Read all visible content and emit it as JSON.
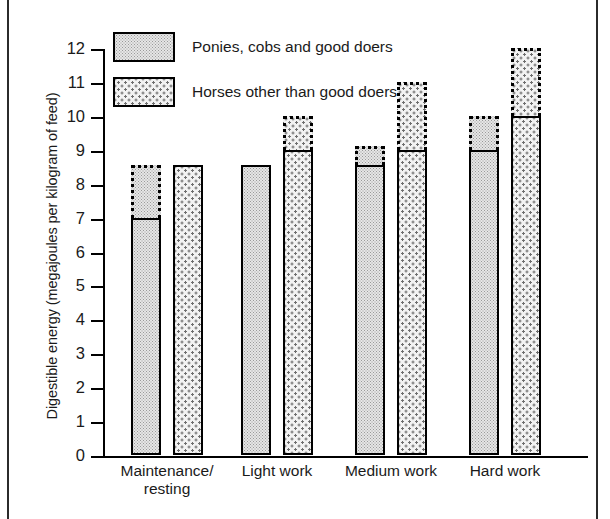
{
  "figure": {
    "ylabel": "Digestible energy (megajoules per kilogram of feed)"
  },
  "legend": {
    "items": [
      {
        "label": "Ponies, cobs and good doers",
        "swatch": "fine-stipple-swatch"
      },
      {
        "label": "Horses other than good doers",
        "swatch": "coarse-dot-swatch"
      }
    ]
  },
  "axis": {
    "yticks": [
      "0",
      "1",
      "2",
      "3",
      "4",
      "5",
      "6",
      "7",
      "8",
      "9",
      "10",
      "11",
      "12"
    ],
    "xticks": [
      {
        "line1": "Maintenance/",
        "line2": "resting"
      },
      {
        "line1": "Light work",
        "line2": ""
      },
      {
        "line1": "Medium work",
        "line2": ""
      },
      {
        "line1": "Hard work",
        "line2": ""
      }
    ]
  },
  "chart_data": {
    "type": "bar",
    "title": "",
    "xlabel": "",
    "ylabel": "Digestible energy (megajoules per kilogram of feed)",
    "ylim": [
      0,
      12
    ],
    "ytick_step": 1,
    "grid": false,
    "legend_position": "top-left-inside",
    "categories": [
      "Maintenance/resting",
      "Light work",
      "Medium work",
      "Hard work"
    ],
    "series": [
      {
        "name": "Ponies, cobs and good doers",
        "values": [
          7.0,
          8.55,
          8.55,
          9.0
        ],
        "range_top": [
          8.55,
          8.55,
          9.1,
          10.0
        ],
        "fill": "fine-stipple",
        "note": "solid outline = typical value; dotted outline above = upper end of range"
      },
      {
        "name": "Horses other than good doers",
        "values": [
          8.55,
          9.0,
          9.0,
          10.0
        ],
        "range_top": [
          8.55,
          10.0,
          11.0,
          12.0
        ],
        "fill": "coarse-dot",
        "note": "solid outline = typical value; dotted outline above = upper end of range"
      }
    ]
  },
  "colors": {
    "ink": "#000000",
    "ponies_fill": "#e6e6e6",
    "horses_fill": "#f2f2f2",
    "page_rule": "#2b2b2b"
  }
}
